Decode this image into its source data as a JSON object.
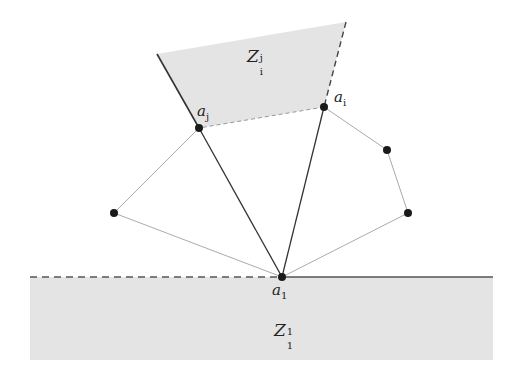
{
  "diagram": {
    "labels": {
      "a1": {
        "base": "a",
        "sub": "1"
      },
      "ai": {
        "base": "a",
        "sub": "i"
      },
      "aj": {
        "base": "a",
        "sub": "j"
      },
      "zij": {
        "base": "Z",
        "sub": "i",
        "sup": "j"
      },
      "z11": {
        "base": "Z",
        "sub": "1",
        "sup": "1"
      }
    },
    "colors": {
      "region_fill": "#e4e4e4",
      "dark_edge": "#333333",
      "light_edge": "#aaaaaa",
      "vertex": "#1a1a1a"
    },
    "vertices": [
      {
        "id": "a1",
        "x": 282,
        "y": 277
      },
      {
        "id": "aj",
        "x": 199,
        "y": 128
      },
      {
        "id": "ai",
        "x": 324,
        "y": 107
      },
      {
        "id": "left",
        "x": 114,
        "y": 213
      },
      {
        "id": "right_upper",
        "x": 387,
        "y": 150
      },
      {
        "id": "right_lower",
        "x": 408,
        "y": 213
      }
    ]
  }
}
